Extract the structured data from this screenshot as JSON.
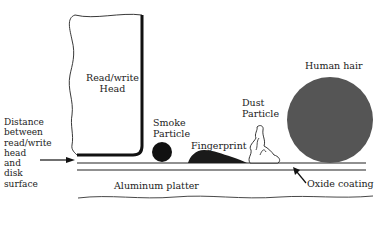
{
  "diagram": {
    "labels": {
      "head": "Read/write\nHead",
      "distance": "Distance\nbetween\nread/write\nhead\nand\ndisk\nsurface",
      "smoke": "Smoke\nParticle",
      "fingerprint": "Fingerprint",
      "dust": "Dust\nParticle",
      "hair": "Human hair",
      "platter": "Aluminum platter",
      "oxide": "Oxide coating"
    },
    "colors": {
      "line": "#111111",
      "hair_fill": "#555555",
      "particle_fill": "#111111"
    }
  }
}
